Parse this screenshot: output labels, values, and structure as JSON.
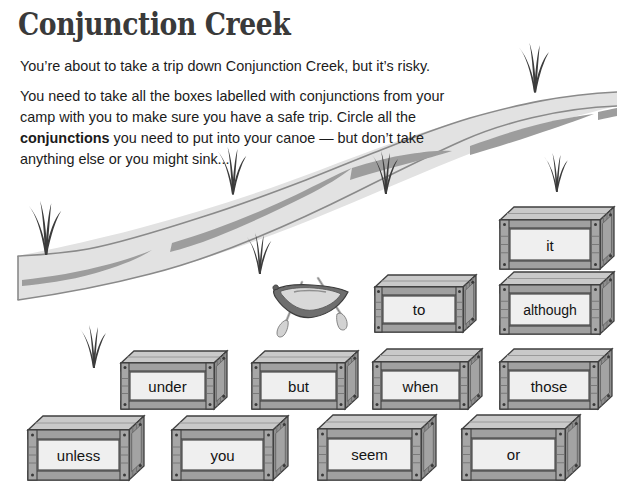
{
  "worksheet": {
    "title": "Conjunction Creek",
    "intro_line_1": "You’re about to take a trip down Conjunction Creek, but it’s risky.",
    "intro_part_1": "You need to take all the boxes labelled with conjunctions from your camp with you to make sure you have a safe trip.  Circle all the ",
    "intro_bold": "conjunctions",
    "intro_part_2": " you need to put into your canoe — but don’t take anything else or you might sink..."
  },
  "illustration": {
    "river_name": "river-band",
    "canoe_name": "canoe",
    "grass_name": "grass-tuft",
    "colors": {
      "river_fill": "#e2e2e2",
      "river_outline": "#7d7d7d",
      "ripple": "#9a9a9a",
      "canoe_hull": "#6e6e6e",
      "canoe_interior": "#d8d8d8",
      "paddle": "#cfcfcf",
      "grass": "#3c3c3c",
      "crate_body": "#b4b4b4",
      "crate_plank": "#a0a0a0",
      "crate_side": "#8e8e8e",
      "crate_outline": "#3f3f3f",
      "crate_label_panel": "#efefef",
      "title_text": "#3a3a3a",
      "body_text": "#1b1b1b"
    }
  },
  "crates": [
    {
      "label": "it",
      "x": 500,
      "y": 207,
      "w": 114,
      "h": 62
    },
    {
      "label": "to",
      "x": 375,
      "y": 275,
      "w": 101,
      "h": 57
    },
    {
      "label": "although",
      "x": 500,
      "y": 272,
      "w": 114,
      "h": 62
    },
    {
      "label": "under",
      "x": 121,
      "y": 351,
      "w": 106,
      "h": 58
    },
    {
      "label": "but",
      "x": 252,
      "y": 351,
      "w": 106,
      "h": 58
    },
    {
      "label": "when",
      "x": 373,
      "y": 349,
      "w": 109,
      "h": 60
    },
    {
      "label": "those",
      "x": 500,
      "y": 349,
      "w": 112,
      "h": 60
    },
    {
      "label": "unless",
      "x": 28,
      "y": 416,
      "w": 116,
      "h": 64
    },
    {
      "label": "you",
      "x": 172,
      "y": 416,
      "w": 116,
      "h": 64
    },
    {
      "label": "seem",
      "x": 318,
      "y": 415,
      "w": 118,
      "h": 65
    },
    {
      "label": "or",
      "x": 462,
      "y": 415,
      "w": 118,
      "h": 65
    }
  ],
  "grass_tufts": [
    {
      "x": 45,
      "y": 252,
      "scale": 1.25,
      "rotate": 0
    },
    {
      "x": 93,
      "y": 366,
      "scale": 1.0,
      "rotate": 0
    },
    {
      "x": 232,
      "y": 192,
      "scale": 1.1,
      "rotate": 0
    },
    {
      "x": 259,
      "y": 272,
      "scale": 0.95,
      "rotate": 0
    },
    {
      "x": 385,
      "y": 192,
      "scale": 1.0,
      "rotate": 0
    },
    {
      "x": 534,
      "y": 90,
      "scale": 1.15,
      "rotate": 0
    },
    {
      "x": 556,
      "y": 190,
      "scale": 0.9,
      "rotate": 0
    }
  ]
}
